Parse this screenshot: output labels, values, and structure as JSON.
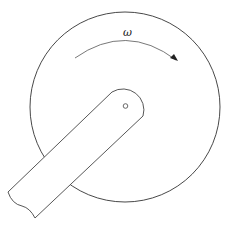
{
  "diagram": {
    "type": "mechanism",
    "labels": {
      "angular_velocity": "ω"
    },
    "elements": {
      "disk": {
        "cx": 125,
        "cy": 107,
        "r": 95
      },
      "pivot_hole": {
        "cx": 125.5,
        "cy": 106,
        "r": 2.3
      },
      "rotation_arrow": {
        "direction": "clockwise"
      },
      "crank_arm": {
        "end": "broken"
      }
    },
    "colors": {
      "stroke": "#333333",
      "background": "#ffffff"
    }
  }
}
